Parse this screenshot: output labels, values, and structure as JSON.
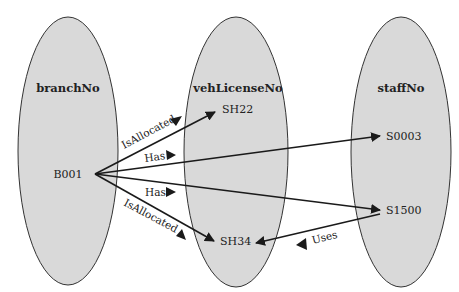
{
  "colors": {
    "ellipse_fill": "#d9d9d9",
    "ellipse_stroke": "#333333",
    "line": "#1a1a1a",
    "background": "#ffffff"
  },
  "sets": [
    {
      "id": "branchNo",
      "title": "branchNo",
      "values": [
        "B001"
      ]
    },
    {
      "id": "vehLicenseNo",
      "title": "vehLicenseNo",
      "values": [
        "SH22",
        "SH34"
      ]
    },
    {
      "id": "staffNo",
      "title": "staffNo",
      "values": [
        "S0003",
        "S1500"
      ]
    }
  ],
  "relationships": [
    {
      "label": "IsAllocated",
      "from": "B001",
      "to": "SH22"
    },
    {
      "label": "Has",
      "from": "B001",
      "to": "S0003"
    },
    {
      "label": "Has",
      "from": "B001",
      "to": "S1500"
    },
    {
      "label": "IsAllocated",
      "from": "B001",
      "to": "SH34"
    },
    {
      "label": "Uses",
      "from": "S1500",
      "to": "SH34"
    }
  ]
}
